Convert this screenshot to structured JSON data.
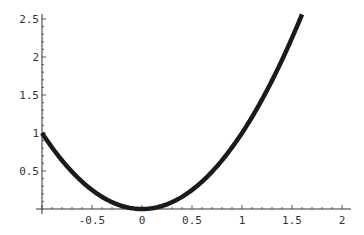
{
  "chart_data": {
    "type": "line",
    "title": "",
    "xlabel": "",
    "ylabel": "",
    "function": "y = x^2",
    "xlim": [
      -1,
      2
    ],
    "ylim": [
      0,
      2.56
    ],
    "grid": false,
    "legend": null,
    "x_ticks": [
      -0.5,
      0,
      0.5,
      1,
      1.5,
      2
    ],
    "x_tick_labels": [
      "-0.5",
      "0",
      "0.5",
      "1",
      "1.5",
      "2"
    ],
    "y_ticks": [
      0.5,
      1,
      1.5,
      2,
      2.5
    ],
    "y_tick_labels": [
      "0.5",
      "1",
      "1.5",
      "2",
      "2.5"
    ],
    "series": [
      {
        "name": "x^2",
        "color": "#1a1a1a",
        "x": [
          -1,
          -0.75,
          -0.5,
          -0.25,
          0,
          0.25,
          0.5,
          0.75,
          1,
          1.25,
          1.5,
          1.6
        ],
        "y": [
          1,
          0.5625,
          0.25,
          0.0625,
          0,
          0.0625,
          0.25,
          0.5625,
          1,
          1.5625,
          2.25,
          2.56
        ]
      }
    ]
  },
  "style": {
    "axis_color": "#333333",
    "curve_color": "#1a1a1a"
  }
}
